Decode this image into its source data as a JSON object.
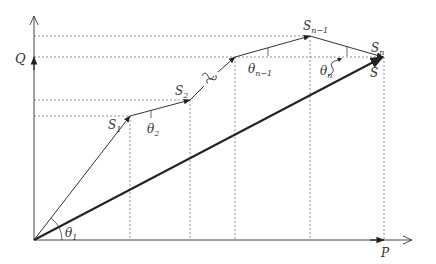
{
  "diagram": {
    "type": "vector-path-decomposition",
    "axes": {
      "x_label": "P",
      "y_label": "Q"
    },
    "points": [
      {
        "id": "S1",
        "base": "S",
        "sub": "1"
      },
      {
        "id": "S2",
        "base": "S",
        "sub": "2"
      },
      {
        "id": "Sn-1",
        "base": "S",
        "sub": "n−1"
      },
      {
        "id": "Sn",
        "base": "S",
        "sub": "n"
      }
    ],
    "resultant_label": "S",
    "angles": [
      {
        "id": "theta1",
        "base": "θ",
        "sub": "1"
      },
      {
        "id": "theta2",
        "base": "θ",
        "sub": "2"
      },
      {
        "id": "thetan-1",
        "base": "θ",
        "sub": "n−1"
      },
      {
        "id": "thetan",
        "base": "θ",
        "sub": "n"
      }
    ],
    "colors": {
      "line": "#333333",
      "thick": "#222222",
      "dotted": "#777777"
    }
  }
}
